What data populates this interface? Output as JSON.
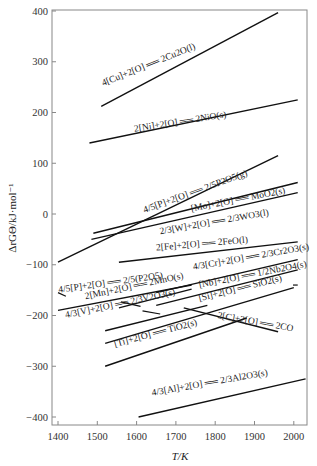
{
  "chart_data": {
    "type": "line",
    "title": "",
    "xlabel": "T/K",
    "ylabel": "ΔrGΘ/kJ·mol⁻¹",
    "xlim": [
      1400,
      2035
    ],
    "ylim": [
      -420,
      400
    ],
    "xticks": [
      1400,
      1500,
      1600,
      1700,
      1800,
      1900,
      2000
    ],
    "yticks": [
      400,
      300,
      200,
      100,
      0,
      -100,
      -200,
      -300,
      -400
    ],
    "grid": false,
    "legend": "none (inline labels)",
    "series": [
      {
        "name": "4[Cu]+2[O] ══ 2Cu2O(l)",
        "x": [
          1510,
          1960
        ],
        "y": [
          212,
          397
        ],
        "label_at": [
          1515,
          252
        ],
        "label_angle": -22
      },
      {
        "name": "2[Ni]+2[O] ══ 2NiO(s)",
        "x": [
          1480,
          2010
        ],
        "y": [
          140,
          225
        ],
        "label_at": [
          1595,
          162
        ],
        "label_angle": -9
      },
      {
        "name": "4/5[P]+2[O] ══ 2/5P2O5(g)",
        "x": [
          1400,
          1960
        ],
        "y": [
          -95,
          115
        ],
        "label_at": [
          1620,
          2
        ],
        "label_angle": -20
      },
      {
        "name": "[Mo]+2[O] ══ MoO2(s)",
        "x": [
          1490,
          2010
        ],
        "y": [
          -38,
          62
        ],
        "label_at": [
          1740,
          5
        ],
        "label_angle": -11
      },
      {
        "name": "2/3[W]+2[O] ══ 2/3WO3(l)",
        "x": [
          1485,
          2010
        ],
        "y": [
          -50,
          42
        ],
        "label_at": [
          1660,
          -40
        ],
        "label_angle": -10
      },
      {
        "name": "2[Fe]+2[O] ══ 2FeO(l)",
        "x": [
          1555,
          2010
        ],
        "y": [
          -95,
          -55
        ],
        "label_at": [
          1650,
          -72
        ],
        "label_angle": -5
      },
      {
        "name": "4/3[Cr]+2[O] ══ 2/3Cr2O3(s)",
        "x": [
          1650,
          2010
        ],
        "y": [
          -155,
          -90
        ],
        "label_at": [
          1745,
          -110
        ],
        "label_angle": -10
      },
      {
        "name": "4/5[P]+2[O] ══ 2/5(P2O5)",
        "x": [
          1400,
          1740
        ],
        "y": [
          -190,
          -140
        ],
        "label_at": [
          1402,
          -155
        ],
        "label_angle": -8
      },
      {
        "name": "2[Mn]+2[O] ══ 2MnO(s)",
        "x": [
          1555,
          1740
        ],
        "y": [
          -185,
          -148
        ],
        "label_at": [
          1470,
          -168
        ],
        "label_angle": -12
      },
      {
        "name": "[Nb]+2[O] ══ 1/2Nb2O4(s)",
        "x": [
          1650,
          2010
        ],
        "y": [
          -180,
          -110
        ],
        "label_at": [
          1760,
          -145
        ],
        "label_angle": -11
      },
      {
        "name": "4/3[V]+2[O] ══ 2/3V2O3(s)",
        "x": [
          1520,
          1780
        ],
        "y": [
          -230,
          -180
        ],
        "label_at": [
          1420,
          -205
        ],
        "label_angle": -12
      },
      {
        "name": "[Si]+2[O] ══ SiO2(s)",
        "x": [
          1520,
          2000
        ],
        "y": [
          -255,
          -145
        ],
        "label_at": [
          1760,
          -172
        ],
        "label_angle": -14
      },
      {
        "name": "2[C]+2[O] ══ 2CO",
        "x": [
          1720,
          1960
        ],
        "y": [
          -185,
          -232
        ],
        "label_at": [
          1805,
          -205
        ],
        "label_angle": 10
      },
      {
        "name": "[Ti]+2[O] ══ TiO2(s)",
        "x": [
          1520,
          1880
        ],
        "y": [
          -300,
          -205
        ],
        "label_at": [
          1545,
          -262
        ],
        "label_angle": -15
      },
      {
        "name": "4/3[Al]+2[O] ══ 2/3Al2O3(s)",
        "x": [
          1605,
          2030
        ],
        "y": [
          -400,
          -325
        ],
        "label_at": [
          1640,
          -358
        ],
        "label_angle": -10
      }
    ],
    "extra_segments": [
      {
        "x": [
          1400,
          1420
        ],
        "y": [
          -155,
          -162
        ]
      },
      {
        "x": [
          1560,
          1610
        ],
        "y": [
          -173,
          -182
        ]
      },
      {
        "x": [
          1615,
          1660
        ],
        "y": [
          -191,
          -197
        ]
      },
      {
        "x": [
          1998,
          2010
        ],
        "y": [
          -140,
          -140
        ]
      }
    ]
  },
  "axes": {
    "x_title": "T/K",
    "y_title": "ΔrGΘ/kJ·mol⁻¹"
  }
}
